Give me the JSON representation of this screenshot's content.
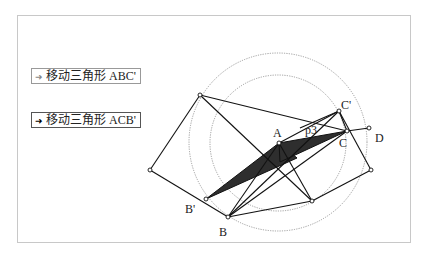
{
  "buttons": [
    {
      "label": "移动三角形 ABC'",
      "icon": "arrow-right-icon"
    },
    {
      "label": "移动三角形 ACB'",
      "icon": "arrow-right-icon"
    }
  ],
  "labels": {
    "A": "A",
    "B": "B",
    "B_prime": "B'",
    "C": "C",
    "C_prime": "C'",
    "D": "D",
    "p3": "p3"
  },
  "colors": {
    "fill": "#2e2e2e",
    "line": "#111111",
    "circle": "#888888",
    "frame": "#c8c8c8"
  }
}
